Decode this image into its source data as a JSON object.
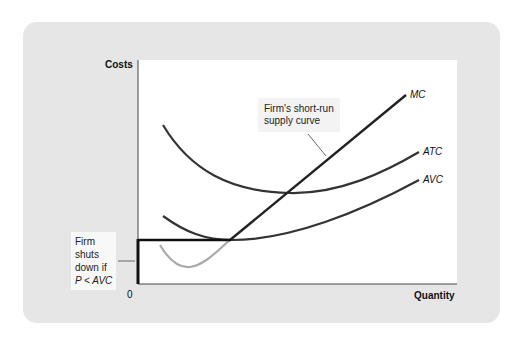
{
  "diagram": {
    "axes": {
      "y_label": "Costs",
      "x_label": "Quantity",
      "origin_label": "0"
    },
    "curves": [
      {
        "name": "MC",
        "label": "MC",
        "style": "dark",
        "note": "portion above AVC minimum is the firm's short-run supply curve; portion below AVC shown light grey"
      },
      {
        "name": "ATC",
        "label": "ATC",
        "style": "dark"
      },
      {
        "name": "AVC",
        "label": "AVC",
        "style": "dark"
      }
    ],
    "annotations": {
      "supply_callout_line1": "Firm's short-run",
      "supply_callout_line2": "supply curve",
      "shutdown_line1": "Firm",
      "shutdown_line2": "shuts",
      "shutdown_line3": "down if",
      "shutdown_line4": "P < AVC"
    },
    "colors": {
      "panel": "#e6e6e6",
      "plot": "#ffffff",
      "curve": "#333333",
      "mc_below_avc": "#aaaaaa",
      "supply_highlight": "#111111"
    }
  }
}
